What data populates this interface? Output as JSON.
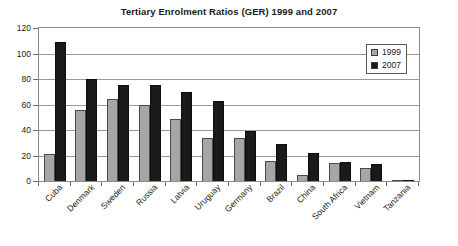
{
  "chart_data": {
    "type": "bar",
    "title": "Tertiary Enrolment Ratios (GER) 1999 and 2007",
    "xlabel": "",
    "ylabel": "",
    "ylim": [
      0,
      120
    ],
    "ytick_step": 20,
    "yticks": [
      0,
      20,
      40,
      60,
      80,
      100,
      120
    ],
    "grid": true,
    "legend_position": "top-right",
    "categories": [
      "Cuba",
      "Denmark",
      "Sweden",
      "Russia",
      "Latvia",
      "Uruguay",
      "Germany",
      "Brazil",
      "China",
      "South Africa",
      "Vietnam",
      "Tanzania"
    ],
    "series": [
      {
        "name": "1999",
        "color": "#a6a6a6",
        "values": [
          21,
          56,
          64,
          60,
          49,
          34,
          34,
          16,
          5,
          14,
          10,
          1
        ]
      },
      {
        "name": "2007",
        "color": "#1a1a1a",
        "values": [
          109,
          80,
          75,
          75,
          70,
          63,
          39,
          29,
          22,
          15,
          13,
          1
        ]
      }
    ]
  },
  "legend": {
    "items": [
      {
        "label": "1999"
      },
      {
        "label": "2007"
      }
    ]
  }
}
